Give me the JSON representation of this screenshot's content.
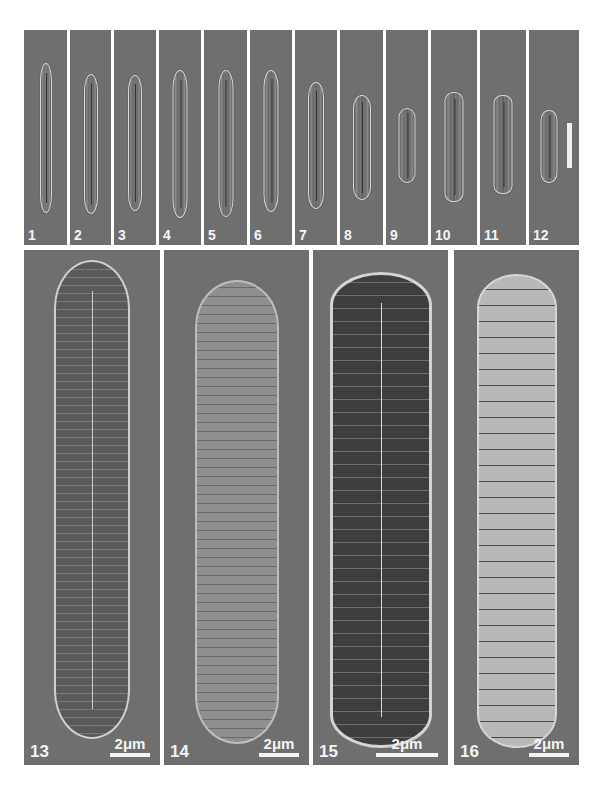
{
  "figure": {
    "background": "#ffffff",
    "panel_gray": "#6f6f6f",
    "label_color": "#f4f4f4"
  },
  "top_row": {
    "panels": [
      {
        "label": "1"
      },
      {
        "label": "2"
      },
      {
        "label": "3"
      },
      {
        "label": "4"
      },
      {
        "label": "5"
      },
      {
        "label": "6"
      },
      {
        "label": "7"
      },
      {
        "label": "8"
      },
      {
        "label": "9"
      },
      {
        "label": "10"
      },
      {
        "label": "11"
      },
      {
        "label": "12"
      }
    ],
    "scale_bar": {
      "location": "panel 12",
      "orientation": "vertical",
      "label": ""
    }
  },
  "bottom_row": {
    "panels": [
      {
        "label": "13",
        "scale": "2μm"
      },
      {
        "label": "14",
        "scale": "2μm"
      },
      {
        "label": "15",
        "scale": "2μm"
      },
      {
        "label": "16",
        "scale": "2μm"
      }
    ]
  }
}
